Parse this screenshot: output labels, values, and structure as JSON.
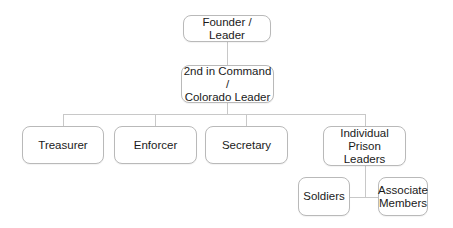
{
  "diagram": {
    "type": "org-chart",
    "line_color": "#c8c8c8",
    "nodes": [
      {
        "id": "founder",
        "label": "Founder / Leader",
        "parent": null
      },
      {
        "id": "second",
        "label": "2nd in Command /\nColorado Leader",
        "parent": "founder"
      },
      {
        "id": "treasurer",
        "label": "Treasurer",
        "parent": "second"
      },
      {
        "id": "enforcer",
        "label": "Enforcer",
        "parent": "second"
      },
      {
        "id": "secretary",
        "label": "Secretary",
        "parent": "second"
      },
      {
        "id": "prison",
        "label": "Individual Prison\nLeaders",
        "parent": "second"
      },
      {
        "id": "soldiers",
        "label": "Soldiers",
        "parent": "prison"
      },
      {
        "id": "associates",
        "label": "Associate\nMembers",
        "parent": "prison"
      }
    ]
  }
}
